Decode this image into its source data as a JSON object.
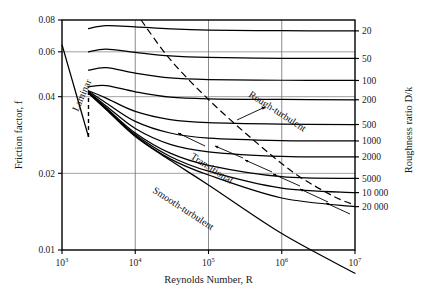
{
  "figure": {
    "background": "#ffffff",
    "ink": "#000000"
  },
  "axes": {
    "x": {
      "title": "Reynolds Number, R",
      "scale": "log",
      "min": 1000,
      "max": 10000000,
      "ticks": [
        {
          "value": 1000,
          "label": "10",
          "exp": "3"
        },
        {
          "value": 10000,
          "label": "10",
          "exp": "4"
        },
        {
          "value": 100000,
          "label": "10",
          "exp": "5"
        },
        {
          "value": 1000000,
          "label": "10",
          "exp": "6"
        },
        {
          "value": 10000000,
          "label": "10",
          "exp": "7"
        }
      ]
    },
    "y": {
      "title": "Friction factor, f",
      "scale": "log",
      "min": 0.01,
      "max": 0.08,
      "ticks": [
        {
          "value": 0.08,
          "label": "0.08"
        },
        {
          "value": 0.06,
          "label": "0.06"
        },
        {
          "value": 0.04,
          "label": "0.04"
        },
        {
          "value": 0.02,
          "label": "0.02"
        },
        {
          "value": 0.01,
          "label": "0.01"
        }
      ]
    },
    "y2": {
      "title": "Roughness ratio D/k",
      "ticks": [
        {
          "label": "20",
          "f_right": 0.0725
        },
        {
          "label": "50",
          "f_right": 0.0565
        },
        {
          "label": "100",
          "f_right": 0.0463
        },
        {
          "label": "200",
          "f_right": 0.0389
        },
        {
          "label": "500",
          "f_right": 0.0311
        },
        {
          "label": "1000",
          "f_right": 0.0268
        },
        {
          "label": "2000",
          "f_right": 0.0232
        },
        {
          "label": "5000",
          "f_right": 0.0191
        },
        {
          "label": "10 000",
          "f_right": 0.0168
        },
        {
          "label": "20 000",
          "f_right": 0.0148
        }
      ]
    }
  },
  "annotations": [
    {
      "id": "laminar",
      "text": "Laminar",
      "x": 78,
      "y": 112,
      "rotate": -66
    },
    {
      "id": "rough-turbulent",
      "text": "Rough-turbulent",
      "x": 248,
      "y": 96,
      "rotate": 33
    },
    {
      "id": "transitional",
      "text": "Transitional",
      "x": 190,
      "y": 158,
      "rotate": 33
    },
    {
      "id": "smooth-turbulent",
      "text": "Smooth-turbulent",
      "x": 152,
      "y": 192,
      "rotate": 33
    }
  ],
  "chart_data": {
    "type": "line",
    "xlabel": "Reynolds Number, R",
    "ylabel": "Friction factor, f",
    "y2label": "Roughness ratio D/k",
    "xscale": "log",
    "yscale": "log",
    "xlim": [
      1000,
      10000000
    ],
    "ylim": [
      0.01,
      0.08
    ],
    "grid": true,
    "legend": "none",
    "annotations": [
      "Laminar",
      "Rough-turbulent",
      "Transitional",
      "Smooth-turbulent"
    ],
    "laminar": {
      "name": "Laminar f = 64/R",
      "style": "solid",
      "x": [
        1000,
        1400,
        2000,
        2300
      ],
      "y": [
        0.064,
        0.0457,
        0.032,
        0.0278
      ]
    },
    "laminar_transition_dashes": {
      "name": "critical-zone transition",
      "style": "dashed",
      "x": [
        2300,
        2300
      ],
      "y": [
        0.0278,
        0.0435
      ]
    },
    "series": [
      {
        "name": "D/k = 20",
        "f_right": 0.0725,
        "x": [
          2300,
          4000,
          10000,
          30000,
          100000,
          1000000,
          10000000
        ],
        "y": [
          0.074,
          0.076,
          0.0752,
          0.0738,
          0.073,
          0.0726,
          0.0725
        ]
      },
      {
        "name": "D/k = 50",
        "f_right": 0.0565,
        "x": [
          2300,
          4000,
          10000,
          30000,
          100000,
          1000000,
          10000000
        ],
        "y": [
          0.06,
          0.0615,
          0.0597,
          0.0578,
          0.057,
          0.0566,
          0.0565
        ]
      },
      {
        "name": "D/k = 100",
        "f_right": 0.0463,
        "x": [
          2300,
          4000,
          10000,
          30000,
          100000,
          1000000,
          10000000
        ],
        "y": [
          0.0508,
          0.052,
          0.0495,
          0.0474,
          0.0467,
          0.0464,
          0.0463
        ]
      },
      {
        "name": "D/k = 200",
        "f_right": 0.0389,
        "x": [
          2300,
          4000,
          10000,
          30000,
          100000,
          1000000,
          10000000
        ],
        "y": [
          0.0437,
          0.0442,
          0.0418,
          0.0398,
          0.0392,
          0.039,
          0.0389
        ]
      },
      {
        "name": "D/k = 500",
        "f_right": 0.0311,
        "x": [
          2300,
          4000,
          10000,
          30000,
          100000,
          1000000,
          10000000
        ],
        "y": [
          0.0422,
          0.0395,
          0.035,
          0.0325,
          0.0316,
          0.0312,
          0.0311
        ]
      },
      {
        "name": "D/k = 1000",
        "f_right": 0.0268,
        "x": [
          2300,
          4000,
          10000,
          30000,
          100000,
          1000000,
          10000000
        ],
        "y": [
          0.042,
          0.0378,
          0.032,
          0.0288,
          0.0275,
          0.0269,
          0.0268
        ]
      },
      {
        "name": "D/k = 2000",
        "f_right": 0.0232,
        "x": [
          2300,
          4000,
          10000,
          30000,
          100000,
          1000000,
          10000000
        ],
        "y": [
          0.0417,
          0.0368,
          0.03,
          0.026,
          0.0243,
          0.0233,
          0.0232
        ]
      },
      {
        "name": "D/k = 5000",
        "f_right": 0.0191,
        "x": [
          2300,
          4000,
          10000,
          30000,
          100000,
          1000000,
          10000000
        ],
        "y": [
          0.0415,
          0.0362,
          0.0288,
          0.024,
          0.0215,
          0.0194,
          0.0191
        ]
      },
      {
        "name": "D/k = 10 000",
        "f_right": 0.0168,
        "x": [
          2300,
          4000,
          10000,
          30000,
          100000,
          1000000,
          10000000
        ],
        "y": [
          0.0414,
          0.036,
          0.0284,
          0.0233,
          0.0204,
          0.0175,
          0.0168
        ]
      },
      {
        "name": "D/k = 20 000",
        "f_right": 0.0148,
        "x": [
          2300,
          4000,
          10000,
          30000,
          100000,
          1000000,
          10000000
        ],
        "y": [
          0.0413,
          0.0358,
          0.0281,
          0.0228,
          0.0197,
          0.016,
          0.0148
        ]
      },
      {
        "name": "Smooth pipe",
        "f_right": 0.0081,
        "x": [
          2300,
          4000,
          10000,
          30000,
          100000,
          1000000,
          10000000
        ],
        "y": [
          0.0412,
          0.0356,
          0.0279,
          0.0225,
          0.018,
          0.0116,
          0.0081
        ]
      }
    ],
    "boundary_dashed": {
      "name": "rough / transitional boundary",
      "style": "dashed",
      "x": [
        12000,
        30000,
        100000,
        400000,
        1500000,
        5000000,
        10000000
      ],
      "y": [
        0.08,
        0.056,
        0.039,
        0.0272,
        0.02,
        0.0163,
        0.015
      ]
    }
  }
}
